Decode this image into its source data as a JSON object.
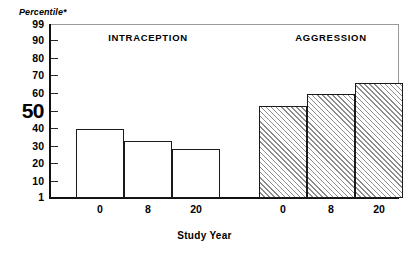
{
  "chart_data": {
    "type": "bar",
    "title": "",
    "ylabel": "Percentile*",
    "xlabel": "Study Year",
    "ylim": [
      1,
      99
    ],
    "grid": false,
    "legend": "none",
    "ytick_labels": [
      "99",
      "90",
      "80",
      "70",
      "60",
      "50",
      "40",
      "30",
      "20",
      "10",
      "1"
    ],
    "ytick_values": [
      99,
      90,
      80,
      70,
      60,
      50,
      40,
      30,
      20,
      10,
      1
    ],
    "categories": [
      "0",
      "8",
      "20"
    ],
    "groups": [
      {
        "name": "INTRACEPTION",
        "fill": "open",
        "categories": [
          "0",
          "8",
          "20"
        ],
        "values": [
          40,
          33.5,
          29
        ]
      },
      {
        "name": "AGGRESSION",
        "fill": "hatched",
        "categories": [
          "0",
          "8",
          "20"
        ],
        "values": [
          53,
          60,
          66
        ]
      }
    ],
    "series": [
      {
        "name": "INTRACEPTION",
        "values": [
          40,
          33.5,
          29
        ]
      },
      {
        "name": "AGGRESSION",
        "values": [
          53,
          60,
          66
        ]
      }
    ],
    "annotations": [
      "50"
    ],
    "colors": {
      "bar_outline": "#1a1a1a",
      "bar_open_fill": "#ffffff",
      "hatch_line": "#8d8d8d",
      "axis": "#111111",
      "frame": "#9a9a9a"
    }
  }
}
